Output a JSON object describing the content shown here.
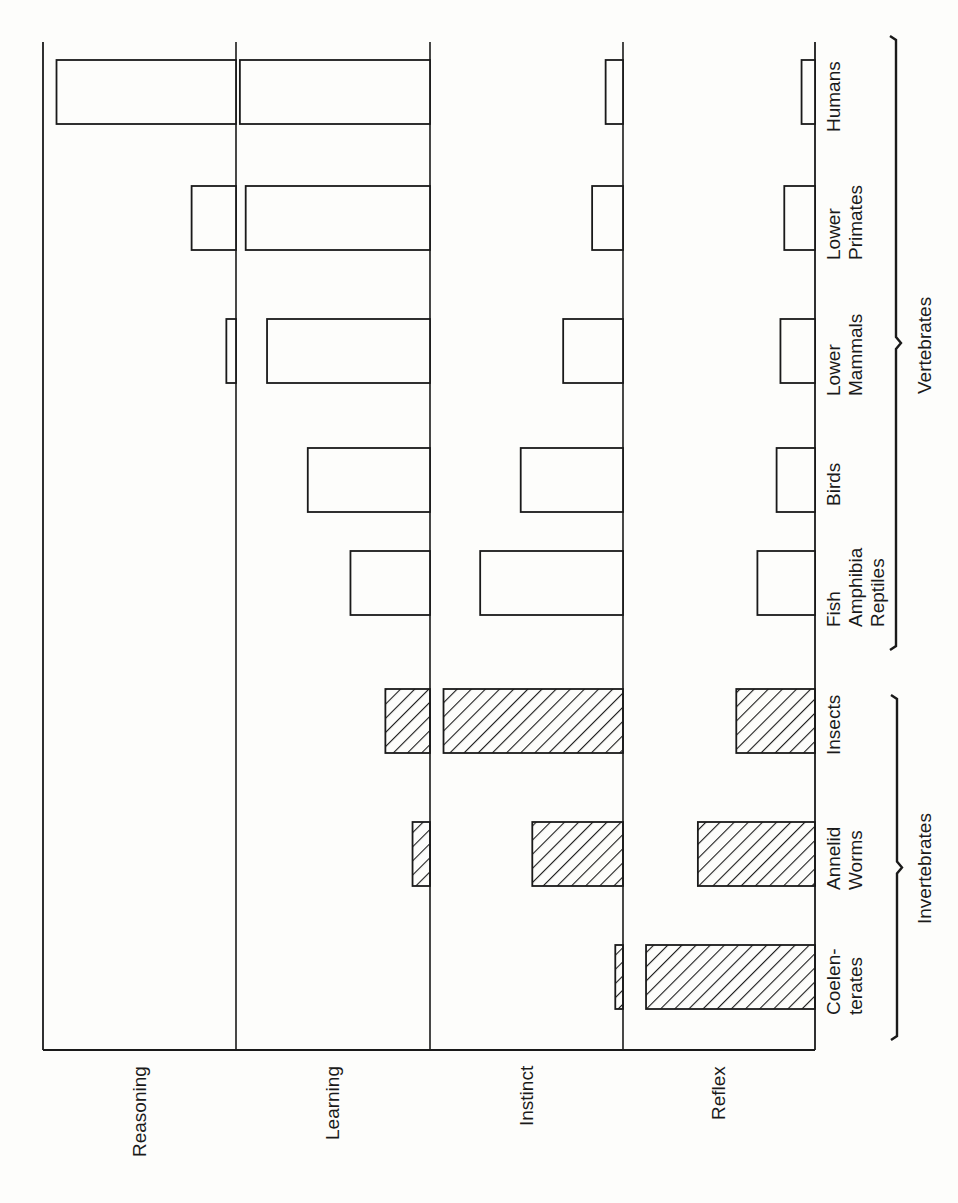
{
  "chart_data": {
    "type": "bar",
    "orientation": "rotated-90 (text reads bottom-to-top); bars grow leftward from each band's baseline",
    "title": "",
    "behaviors": [
      "Reasoning",
      "Learning",
      "Instinct",
      "Reflex"
    ],
    "categories": [
      "Coelenterates",
      "Annelid Worms",
      "Insects",
      "Fish Amphibia Reptiles",
      "Birds",
      "Lower Mammals",
      "Lower Primates",
      "Humans"
    ],
    "category_labels": [
      "Coelen-\nterates",
      "Annelid\nWorms",
      "Insects",
      "Fish\nAmphibia\nReptiles",
      "Birds",
      "Lower\nMammals",
      "Lower\nPrimates",
      "Humans"
    ],
    "groups": [
      {
        "name": "Invertebrates",
        "members": [
          "Coelenterates",
          "Annelid Worms",
          "Insects"
        ],
        "pattern": "hatched"
      },
      {
        "name": "Vertebrates",
        "members": [
          "Fish Amphibia Reptiles",
          "Birds",
          "Lower Mammals",
          "Lower Primates",
          "Humans"
        ],
        "pattern": "open"
      }
    ],
    "scale": "relative 0-1 within each behavior band (no numeric axis shown)",
    "series": [
      {
        "name": "Reasoning",
        "values": [
          0,
          0,
          0,
          0,
          0,
          0.05,
          0.23,
          0.93
        ]
      },
      {
        "name": "Learning",
        "values": [
          0,
          0.09,
          0.23,
          0.41,
          0.63,
          0.84,
          0.95,
          0.98
        ]
      },
      {
        "name": "Instinct",
        "values": [
          0.04,
          0.47,
          0.93,
          0.74,
          0.53,
          0.31,
          0.16,
          0.09
        ]
      },
      {
        "name": "Reflex",
        "values": [
          0.88,
          0.61,
          0.41,
          0.3,
          0.2,
          0.18,
          0.16,
          0.07
        ]
      }
    ],
    "xlabel": "",
    "ylabel": "",
    "grid": true,
    "legend": "none"
  },
  "labels": {
    "behaviors": [
      "Reasoning",
      "Learning",
      "Instinct",
      "Reflex"
    ],
    "group_invertebrates": "Invertebrates",
    "group_vertebrates": "Vertebrates"
  },
  "colors": {
    "ink": "#1a1a1a",
    "paper": "#fdfdfb"
  }
}
